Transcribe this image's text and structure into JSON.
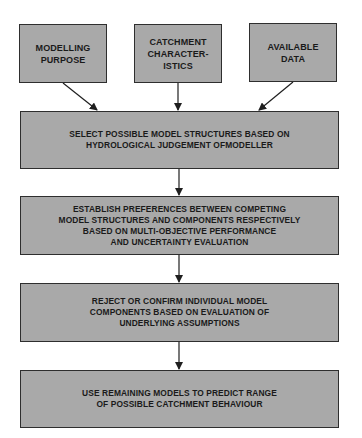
{
  "diagram": {
    "type": "flowchart",
    "colors": {
      "box_fill": "#a9a9a9",
      "box_border": "#2e2e2e",
      "text": "#1a1a1a",
      "arrow": "#1f1f1f"
    },
    "inputs": [
      {
        "id": "modelling-purpose",
        "lines": [
          "MODELLING",
          "PURPOSE"
        ]
      },
      {
        "id": "catchment-characteristics",
        "lines": [
          "CATCHMENT",
          "CHARACTER-",
          "ISTICS"
        ]
      },
      {
        "id": "available-data",
        "lines": [
          "AVAILABLE",
          "DATA"
        ]
      }
    ],
    "steps": [
      {
        "id": "select-structures",
        "lines": [
          "SELECT POSSIBLE MODEL STRUCTURES BASED ON",
          "HYDROLOGICAL JUDGEMENT OFMODELLER"
        ]
      },
      {
        "id": "establish-preferences",
        "lines": [
          "ESTABLISH PREFERENCES BETWEEN COMPETING",
          "MODEL STRUCTURES AND COMPONENTS RESPECTIVELY",
          "BASED ON MULTI-OBJECTIVE PERFORMANCE",
          "AND UNCERTAINTY EVALUATION"
        ]
      },
      {
        "id": "reject-confirm",
        "lines": [
          "REJECT OR CONFIRM INDIVIDUAL MODEL",
          "COMPONENTS BASED ON EVALUATION OF",
          "UNDERLYING ASSUMPTIONS"
        ]
      },
      {
        "id": "predict-range",
        "lines": [
          "USE REMAINING MODELS TO PREDICT RANGE",
          "OF POSSIBLE CATCHMENT BEHAVIOUR"
        ]
      }
    ],
    "edges": [
      {
        "from": "modelling-purpose",
        "to": "select-structures"
      },
      {
        "from": "catchment-characteristics",
        "to": "select-structures"
      },
      {
        "from": "available-data",
        "to": "select-structures"
      },
      {
        "from": "select-structures",
        "to": "establish-preferences"
      },
      {
        "from": "establish-preferences",
        "to": "reject-confirm"
      },
      {
        "from": "reject-confirm",
        "to": "predict-range"
      }
    ]
  }
}
